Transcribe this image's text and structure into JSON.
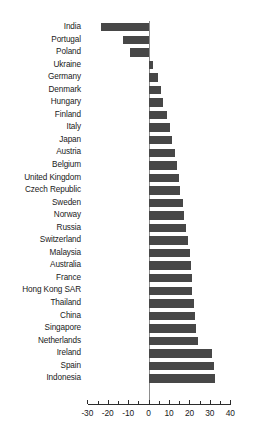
{
  "chart_data": {
    "type": "bar",
    "orientation": "horizontal",
    "title": "",
    "subtitle": "",
    "xlabel": "",
    "ylabel": "",
    "xlim": [
      -30,
      40
    ],
    "grid": false,
    "legend": null,
    "bar_color": "#474747",
    "axis_color": "#2b2b2b",
    "zero_line_color": "#8d8d8d",
    "xticks": [
      -30,
      -20,
      -10,
      0,
      10,
      20,
      30,
      40
    ],
    "xtick_labels": [
      "-30",
      "-20",
      "-10",
      "0",
      "10",
      "20",
      "30",
      "40"
    ],
    "minor_tick_step": 5,
    "categories": [
      "India",
      "Portugal",
      "Poland",
      "Ukraine",
      "Germany",
      "Denmark",
      "Hungary",
      "Finland",
      "Italy",
      "Japan",
      "Austria",
      "Belgium",
      "United Kingdom",
      "Czech Republic",
      "Sweden",
      "Norway",
      "Russia",
      "Switzerland",
      "Malaysia",
      "Australia",
      "France",
      "Hong Kong SAR",
      "Thailand",
      "China",
      "Singapore",
      "Netherlands",
      "Ireland",
      "Spain",
      "Indonesia"
    ],
    "values": [
      -23.5,
      -12.3,
      -9.3,
      2.4,
      4.6,
      6.1,
      7.2,
      9.2,
      10.3,
      11.3,
      12.8,
      13.9,
      15.1,
      15.6,
      16.9,
      17.4,
      18.2,
      19.4,
      20.1,
      20.9,
      21.4,
      21.5,
      22.1,
      22.6,
      23.2,
      24.1,
      31.2,
      32.1,
      32.6
    ]
  }
}
